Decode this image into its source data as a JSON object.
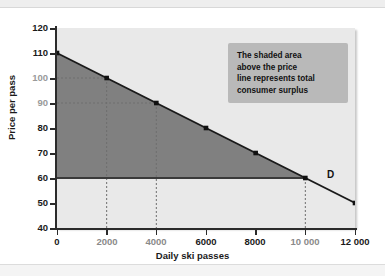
{
  "chart_data": {
    "type": "line",
    "title": "",
    "xlabel": "Daily ski passes",
    "ylabel": "Price per pass",
    "xlim": [
      0,
      12000
    ],
    "ylim": [
      40,
      120
    ],
    "grid": false,
    "legend": "none",
    "series": [
      {
        "name": "D",
        "label": "D",
        "x": [
          0,
          2000,
          4000,
          6000,
          8000,
          10000,
          12000
        ],
        "values": [
          110,
          100,
          90,
          80,
          70,
          60,
          50
        ]
      }
    ],
    "market_price": 60,
    "equilibrium_quantity": 10000,
    "shaded_region": {
      "name": "consumer surplus",
      "vertices": [
        [
          0,
          110
        ],
        [
          10000,
          60
        ],
        [
          0,
          60
        ]
      ],
      "color": "#808080"
    },
    "annotations": [
      {
        "name": "consumer-surplus-note",
        "text": "The shaded area above the price line represents total consumer surplus"
      },
      {
        "name": "demand-curve-label",
        "text": "D"
      }
    ],
    "guide_lines": [
      {
        "x": 2000,
        "y": 100
      },
      {
        "x": 4000,
        "y": 90
      },
      {
        "x": 10000,
        "y": 60
      }
    ],
    "yticks": [
      {
        "value": 40,
        "label": "40",
        "muted": false
      },
      {
        "value": 50,
        "label": "50",
        "muted": false
      },
      {
        "value": 60,
        "label": "60",
        "muted": false
      },
      {
        "value": 70,
        "label": "70",
        "muted": false
      },
      {
        "value": 80,
        "label": "80",
        "muted": false
      },
      {
        "value": 90,
        "label": "90",
        "muted": true
      },
      {
        "value": 100,
        "label": "100",
        "muted": true
      },
      {
        "value": 110,
        "label": "110",
        "muted": false
      },
      {
        "value": 120,
        "label": "120",
        "muted": false
      }
    ],
    "xticks": [
      {
        "value": 0,
        "label": "0",
        "muted": false
      },
      {
        "value": 2000,
        "label": "2000",
        "muted": true
      },
      {
        "value": 4000,
        "label": "4000",
        "muted": true
      },
      {
        "value": 6000,
        "label": "6000",
        "muted": false
      },
      {
        "value": 8000,
        "label": "8000",
        "muted": false
      },
      {
        "value": 10000,
        "label": "10 000",
        "muted": true
      },
      {
        "value": 12000,
        "label": "12 000",
        "muted": false
      }
    ]
  },
  "note": {
    "line1": "The shaded area",
    "line2": "above the price",
    "line3": "line represents total",
    "line4": "consumer surplus"
  },
  "axis": {
    "y_title": "Price per pass",
    "x_title": "Daily ski passes"
  },
  "curve_label": "D",
  "colors": {
    "surplus_fill": "#808080",
    "plot_background": "#e9e9e9",
    "axis": "#2b2b2b",
    "note_background": "#b9b9b9",
    "demand_line": "#1a1a1a"
  }
}
